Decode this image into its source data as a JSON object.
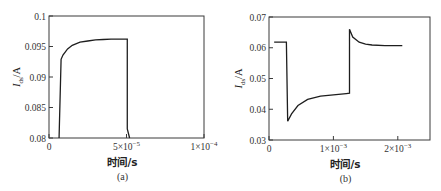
{
  "chart_data": [
    {
      "type": "line",
      "panel_label": "(a)",
      "title": "",
      "xlabel": "时间/s",
      "ylabel": "I_ds/A",
      "ylabel_main": "I",
      "ylabel_sub": "ds",
      "ylabel_unit": "/A",
      "xlim": [
        0,
        0.0001
      ],
      "ylim": [
        0.08,
        0.1
      ],
      "x_ticks": [
        {
          "value": 0,
          "label": "0",
          "exp": ""
        },
        {
          "value": 5e-05,
          "label": "5×10",
          "exp": "−5"
        },
        {
          "value": 0.0001,
          "label": "1×10",
          "exp": "−4"
        }
      ],
      "y_ticks": [
        {
          "value": 0.08,
          "label": "0.08"
        },
        {
          "value": 0.085,
          "label": "0.085"
        },
        {
          "value": 0.09,
          "label": "0.09"
        },
        {
          "value": 0.095,
          "label": "0.095"
        },
        {
          "value": 0.1,
          "label": "0.1"
        }
      ],
      "grid": false,
      "legend": null,
      "series": [
        {
          "name": "I_ds",
          "x": [
            6.5e-06,
            7.8e-06,
            9e-06,
            1.2e-05,
            1.5e-05,
            2e-05,
            2.5e-05,
            3e-05,
            3.5e-05,
            4e-05,
            4.5e-05,
            5.05e-05,
            5.05e-05,
            5.2e-05
          ],
          "y": [
            0.08,
            0.0929,
            0.0936,
            0.0946,
            0.0952,
            0.0957,
            0.0959,
            0.0961,
            0.09615,
            0.0962,
            0.0962,
            0.0962,
            0.0815,
            0.08
          ]
        }
      ]
    },
    {
      "type": "line",
      "panel_label": "(b)",
      "title": "",
      "xlabel": "时间/s",
      "ylabel": "I_ds/A",
      "ylabel_main": "I",
      "ylabel_sub": "ds",
      "ylabel_unit": "/A",
      "xlim": [
        0,
        0.0025
      ],
      "ylim": [
        0.03,
        0.07
      ],
      "x_ticks": [
        {
          "value": 0,
          "label": "0",
          "exp": ""
        },
        {
          "value": 0.001,
          "label": "1×10",
          "exp": "−3"
        },
        {
          "value": 0.002,
          "label": "2×10",
          "exp": "−3"
        }
      ],
      "y_ticks": [
        {
          "value": 0.03,
          "label": "0.03"
        },
        {
          "value": 0.04,
          "label": "0.04"
        },
        {
          "value": 0.05,
          "label": "0.05"
        },
        {
          "value": 0.06,
          "label": "0.06"
        },
        {
          "value": 0.07,
          "label": "0.07"
        }
      ],
      "grid": false,
      "legend": null,
      "series": [
        {
          "name": "I_ds",
          "x": [
            8e-05,
            0.00027,
            0.00027,
            0.00029,
            0.00035,
            0.00045,
            0.0006,
            0.0008,
            0.001,
            0.0012,
            0.00125,
            0.00125,
            0.0013,
            0.0014,
            0.0015,
            0.0016,
            0.0018,
            0.002,
            0.00207
          ],
          "y": [
            0.0618,
            0.0618,
            0.0618,
            0.0361,
            0.0385,
            0.0412,
            0.0432,
            0.0443,
            0.0447,
            0.0451,
            0.0452,
            0.066,
            0.0635,
            0.0618,
            0.0612,
            0.0609,
            0.0607,
            0.0607,
            0.0607
          ]
        }
      ]
    }
  ],
  "style": {
    "line_color": "#1e1e1e",
    "axis_color": "#3a3a3a"
  }
}
